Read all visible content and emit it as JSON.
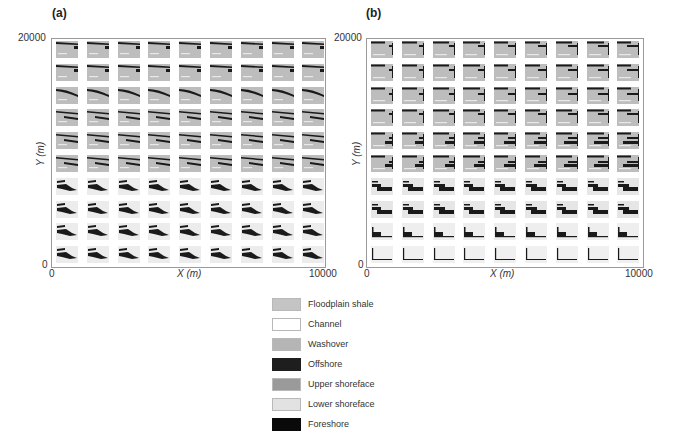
{
  "figure": {
    "panels": [
      {
        "label": "(a)",
        "x_axis": {
          "label": "X (m)",
          "min_tick": "0",
          "max_tick": "10000"
        },
        "y_axis": {
          "label": "Y (m)",
          "min_tick": "0",
          "max_tick": "20000"
        },
        "grid": {
          "rows": 10,
          "cols": 9
        }
      },
      {
        "label": "(b)",
        "x_axis": {
          "label": "X (m)",
          "min_tick": "0",
          "max_tick": "10000"
        },
        "y_axis": {
          "label": "Y (m)",
          "min_tick": "0",
          "max_tick": "20000"
        },
        "grid": {
          "rows": 10,
          "cols": 9
        }
      }
    ],
    "legend": [
      {
        "label": "Floodplain shale",
        "color": "#c4c4c4"
      },
      {
        "label": "Channel",
        "color": "#ffffff"
      },
      {
        "label": "Washover",
        "color": "#b5b5b5"
      },
      {
        "label": "Offshore",
        "color": "#1e1e1e"
      },
      {
        "label": "Upper shoreface",
        "color": "#9a9a9a"
      },
      {
        "label": "Lower shoreface",
        "color": "#e2e2e2"
      },
      {
        "label": "Foreshore",
        "color": "#0a0a0a"
      }
    ]
  }
}
